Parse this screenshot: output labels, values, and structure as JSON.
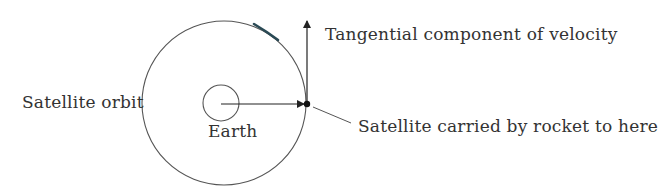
{
  "diagram": {
    "labels": {
      "tangential": "Tangential component of velocity",
      "orbit": "Satellite orbit",
      "earth": "Earth",
      "satellite": "Satellite carried by rocket to here"
    },
    "colors": {
      "line": "#555555",
      "arrow": "#222222",
      "highlight_arc": "#2a4a55",
      "text": "#333333",
      "background": "#ffffff"
    },
    "geometry": {
      "orbit": {
        "cx": 224,
        "cy": 103,
        "r": 82
      },
      "earth": {
        "cx": 221,
        "cy": 103,
        "r": 18
      },
      "satellite": {
        "x": 307,
        "y": 104
      }
    }
  }
}
